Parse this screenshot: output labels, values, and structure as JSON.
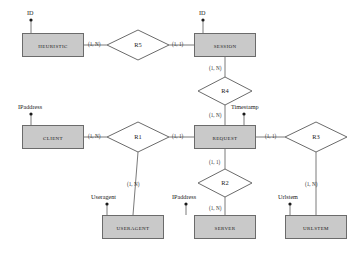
{
  "diagram": {
    "type": "entity-relationship-diagram",
    "canvas": {
      "width": 357,
      "height": 255
    },
    "colors": {
      "entity_fill": "#c9c9c9",
      "entity_stroke": "#6b6b6b",
      "diamond_fill": "#ffffff",
      "diamond_stroke": "#6b6b6b",
      "line": "#7a7a7a",
      "text": "#1a1a1a",
      "background": "#ffffff"
    },
    "entities": [
      {
        "id": "heuristic",
        "label": "Heuristic",
        "x": 22,
        "y": 33,
        "w": 62,
        "h": 24
      },
      {
        "id": "session",
        "label": "Session",
        "x": 194,
        "y": 33,
        "w": 62,
        "h": 24
      },
      {
        "id": "client",
        "label": "Client",
        "x": 22,
        "y": 125,
        "w": 62,
        "h": 24
      },
      {
        "id": "request",
        "label": "Request",
        "x": 194,
        "y": 125,
        "w": 62,
        "h": 24
      },
      {
        "id": "useragent",
        "label": "UserAgent",
        "x": 102,
        "y": 215,
        "w": 62,
        "h": 24
      },
      {
        "id": "server",
        "label": "Server",
        "x": 194,
        "y": 215,
        "w": 62,
        "h": 24
      },
      {
        "id": "urlstem",
        "label": "UrlStem",
        "x": 285,
        "y": 215,
        "w": 62,
        "h": 24
      }
    ],
    "relationships": [
      {
        "id": "r5",
        "label": "R5",
        "cx": 138,
        "cy": 45,
        "rx": 31,
        "ry": 15
      },
      {
        "id": "r4",
        "label": "R4",
        "cx": 225,
        "cy": 91,
        "rx": 27,
        "ry": 14
      },
      {
        "id": "r1",
        "label": "R1",
        "cx": 138,
        "cy": 137,
        "rx": 31,
        "ry": 15
      },
      {
        "id": "r3",
        "label": "R3",
        "cx": 316,
        "cy": 137,
        "rx": 31,
        "ry": 15
      },
      {
        "id": "r2",
        "label": "R2",
        "cx": 225,
        "cy": 183,
        "rx": 27,
        "ry": 14
      }
    ],
    "attributes": [
      {
        "id": "heuristic-id",
        "label": "ID",
        "x": 27,
        "y": 9,
        "dot_x": 31,
        "dot_y": 20,
        "line_to_x": 31,
        "line_to_y": 33
      },
      {
        "id": "session-id",
        "label": "ID",
        "x": 199,
        "y": 9,
        "dot_x": 203,
        "dot_y": 20,
        "line_to_x": 203,
        "line_to_y": 33
      },
      {
        "id": "client-ipaddress",
        "label": "IPaddress",
        "x": 18,
        "y": 103,
        "dot_x": 31,
        "dot_y": 114,
        "line_to_x": 31,
        "line_to_y": 125
      },
      {
        "id": "request-timestamp",
        "label": "Timestamp",
        "x": 231,
        "y": 103,
        "dot_x": 244,
        "dot_y": 114,
        "line_to_x": 244,
        "line_to_y": 125
      },
      {
        "id": "useragent-useragent",
        "label": "Useragent",
        "x": 91,
        "y": 193,
        "dot_x": 107,
        "dot_y": 204,
        "line_to_x": 107,
        "line_to_y": 215
      },
      {
        "id": "server-ipaddress",
        "label": "IPaddress",
        "x": 172,
        "y": 193,
        "dot_x": 186,
        "dot_y": 204,
        "line_to_x": 186,
        "line_to_y": 215
      },
      {
        "id": "urlstem-urlstem",
        "label": "Urlstem",
        "x": 278,
        "y": 193,
        "dot_x": 290,
        "dot_y": 204,
        "line_to_x": 290,
        "line_to_y": 215
      }
    ],
    "connections": [
      {
        "id": "heuristic-r5",
        "from": "heuristic",
        "to": "r5",
        "cardinality": "(1, N)",
        "label_x": 88,
        "label_y": 41
      },
      {
        "id": "r5-session",
        "from": "r5",
        "to": "session",
        "cardinality": "(1, 1)",
        "label_x": 172,
        "label_y": 41
      },
      {
        "id": "session-r4",
        "from": "session",
        "to": "r4",
        "cardinality": "(1, N)",
        "label_x": 209,
        "label_y": 65
      },
      {
        "id": "r4-request",
        "from": "r4",
        "to": "request",
        "cardinality": "(1, N)",
        "label_x": 209,
        "label_y": 112
      },
      {
        "id": "client-r1",
        "from": "client",
        "to": "r1",
        "cardinality": "(1, N)",
        "label_x": 88,
        "label_y": 133
      },
      {
        "id": "r1-request",
        "from": "r1",
        "to": "request",
        "cardinality": "(1, 1)",
        "label_x": 172,
        "label_y": 133
      },
      {
        "id": "r1-useragent",
        "from": "r1",
        "to": "useragent",
        "cardinality": "(1, N)",
        "label_x": 127,
        "label_y": 181
      },
      {
        "id": "request-r3",
        "from": "request",
        "to": "r3",
        "cardinality": "(1, 1)",
        "label_x": 265,
        "label_y": 133
      },
      {
        "id": "r3-urlstem",
        "from": "r3",
        "to": "urlstem",
        "cardinality": "(1, N)",
        "label_x": 305,
        "label_y": 181
      },
      {
        "id": "request-r2",
        "from": "request",
        "to": "r2",
        "cardinality": "(1, 1)",
        "label_x": 209,
        "label_y": 159
      },
      {
        "id": "r2-server",
        "from": "r2",
        "to": "server",
        "cardinality": "(1, N)",
        "label_x": 209,
        "label_y": 205
      }
    ]
  }
}
